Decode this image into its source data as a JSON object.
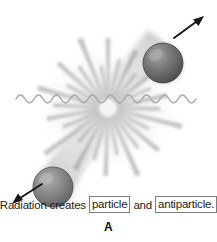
{
  "figure": {
    "panel_label": "A",
    "background_color": "#ffffff"
  },
  "caption": {
    "lead_text": "Radiation creates",
    "boxed_term_1": "particle",
    "conjunction": "and",
    "boxed_term_2": "antiparticle.",
    "box_border_color": "#7d7d7d",
    "text_color": "#1d1d1d"
  },
  "diagram": {
    "type": "pair-production-illustration",
    "wave": {
      "label": "radiation-wave",
      "color": "#b3b3b3",
      "center_y": 99,
      "amplitude": 4,
      "wavelength": 18,
      "x_start": 16,
      "x_end": 200
    },
    "burst": {
      "label": "annihilation-burst",
      "center_x": 108,
      "center_y": 108,
      "ray_count": 28,
      "color": "#9a9a9a"
    },
    "particles": [
      {
        "name": "particle-sphere-upper-right",
        "cx": 163,
        "cy": 63,
        "r": 20,
        "fill_color": "#5f5f5f",
        "highlight_color": "#9e9e9e",
        "direction": "up-right"
      },
      {
        "name": "antiparticle-sphere-lower-left",
        "cx": 53,
        "cy": 187,
        "r": 20,
        "fill_color": "#6b6b6b",
        "highlight_color": "#a8a8a8",
        "direction": "down-left"
      }
    ],
    "trails": [
      {
        "name": "trail-upper-right",
        "color": "#c9c9c9"
      },
      {
        "name": "trail-lower-left",
        "color": "#c9c9c9"
      }
    ],
    "arrows": [
      {
        "name": "momentum-arrow-up-right",
        "color": "#161616",
        "x1": 174,
        "y1": 38,
        "x2": 203,
        "y2": 17
      },
      {
        "name": "momentum-arrow-down-left",
        "color": "#161616",
        "x1": 42,
        "y1": 184,
        "x2": 13,
        "y2": 203
      }
    ]
  }
}
